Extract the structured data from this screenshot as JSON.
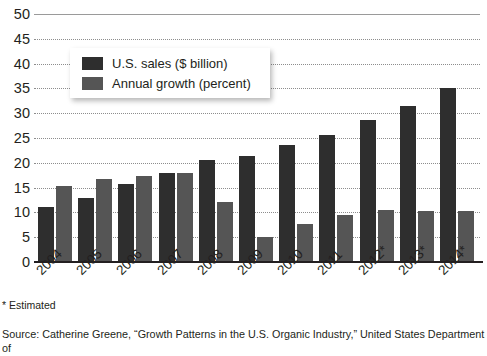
{
  "chart_data": {
    "type": "bar",
    "title": "",
    "xlabel": "",
    "ylabel": "",
    "ylim": [
      0,
      50
    ],
    "yticks": [
      50,
      45,
      40,
      35,
      30,
      25,
      20,
      15,
      10,
      5,
      0
    ],
    "grid": true,
    "legend_position": "upper-left-inside",
    "categories": [
      "2004",
      "2005",
      "2006",
      "2007",
      "2008",
      "2009",
      "2010",
      "2011",
      "2012*",
      "2013*",
      "2014*"
    ],
    "series": [
      {
        "name": "U.S. sales ($ billion)",
        "color": "#2e2e2e",
        "values": [
          11.0,
          12.9,
          15.7,
          18.0,
          20.5,
          21.4,
          23.6,
          25.7,
          28.6,
          31.5,
          35.1
        ]
      },
      {
        "name": "Annual growth (percent)",
        "color": "#555555",
        "values": [
          15.3,
          16.7,
          17.3,
          18.0,
          12.2,
          5.1,
          7.7,
          9.5,
          10.4,
          10.3,
          10.3
        ]
      }
    ]
  },
  "legend": {
    "items": [
      {
        "label": "U.S. sales ($ billion)",
        "color": "#2e2e2e"
      },
      {
        "label": "Annual growth (percent)",
        "color": "#555555"
      }
    ]
  },
  "footnote": "* Estimated",
  "source": "Source: Catherine Greene, “Growth Patterns in the U.S. Organic Industry,” United States Department of"
}
